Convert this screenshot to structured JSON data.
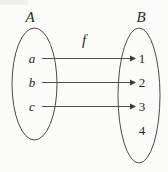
{
  "diagram": {
    "type": "function-mapping-diagram",
    "title": "",
    "function_label": "f",
    "domain_set": {
      "name": "A",
      "label": "A",
      "elements": [
        "a",
        "b",
        "c"
      ]
    },
    "codomain_set": {
      "name": "B",
      "label": "B",
      "elements": [
        "1",
        "2",
        "3",
        "4"
      ]
    },
    "mappings": [
      {
        "from": "a",
        "to": "1"
      },
      {
        "from": "b",
        "to": "2"
      },
      {
        "from": "c",
        "to": "3"
      }
    ],
    "unmapped_codomain_elements": [
      "4"
    ],
    "colors": {
      "background": "#fbfbfa",
      "stroke": "#4a4a4a",
      "text": "#262626",
      "arrow": "#4f4f4f"
    }
  }
}
